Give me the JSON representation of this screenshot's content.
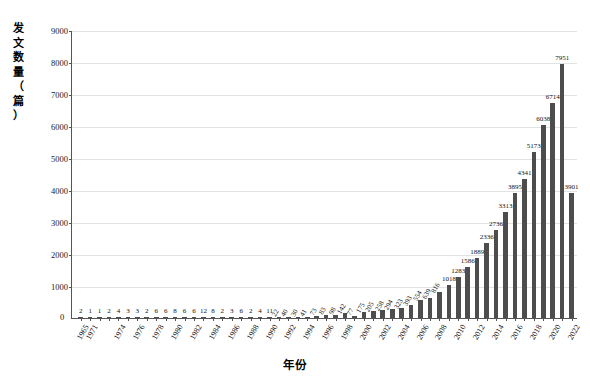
{
  "chart_data": {
    "type": "bar",
    "title": "",
    "subtitle": "",
    "xlabel": "年份",
    "ylabel": "发文数量（篇）",
    "ylim": [
      0,
      9000
    ],
    "ytick_labels": [
      "0",
      "1000",
      "2000",
      "3000",
      "4000",
      "5000",
      "6000",
      "7000",
      "8000",
      "9000"
    ],
    "ytick_values": [
      0,
      1000,
      2000,
      3000,
      4000,
      5000,
      6000,
      7000,
      8000,
      9000
    ],
    "grid": true,
    "legend": false,
    "bar_color": "#4d4d4d",
    "categories": [
      "1965",
      "1971",
      "1972",
      "1973",
      "1974",
      "1975",
      "1976",
      "1977",
      "1978",
      "1979",
      "1980",
      "1981",
      "1982",
      "1983",
      "1984",
      "1985",
      "1986",
      "1987",
      "1988",
      "1989",
      "1990",
      "1991",
      "1992",
      "1993",
      "1994",
      "1995",
      "1996",
      "1997",
      "1998",
      "1999",
      "2000",
      "2001",
      "2002",
      "2003",
      "2004",
      "2005",
      "2006",
      "2007",
      "2008",
      "2009",
      "2010",
      "2011",
      "2012",
      "2013",
      "2014",
      "2015",
      "2016",
      "2017",
      "2018",
      "2019",
      "2020",
      "2021",
      "2022"
    ],
    "values": [
      2,
      1,
      1,
      2,
      4,
      3,
      3,
      2,
      6,
      6,
      8,
      6,
      6,
      12,
      8,
      2,
      3,
      6,
      2,
      4,
      11,
      22,
      40,
      30,
      41,
      73,
      83,
      98,
      142,
      77,
      175,
      205,
      258,
      294,
      323,
      393,
      554,
      639,
      816,
      1018,
      1283,
      1586,
      1889,
      2336,
      2736,
      3313,
      3895,
      4341,
      5173,
      6038,
      6714,
      7951,
      3901
    ],
    "xtick_labels_shown": [
      "1965",
      "1971",
      "1974",
      "1976",
      "1978",
      "1980",
      "1982",
      "1984",
      "1986",
      "1988",
      "1990",
      "1992",
      "1994",
      "1996",
      "1998",
      "2000",
      "2002",
      "2004",
      "2006",
      "2008",
      "2010",
      "2012",
      "2014",
      "2016",
      "2018",
      "2020",
      "2022"
    ]
  },
  "axis": {
    "y_title_chars": [
      "发",
      "文",
      "数",
      "量",
      "（",
      "篇",
      "）"
    ],
    "zero_label": "0"
  }
}
